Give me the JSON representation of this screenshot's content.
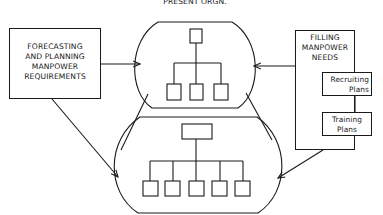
{
  "title": "PRESENT ORGN.",
  "left_box": {
    "lines": [
      "FORECASTING",
      "AND PLANNING",
      "MANPOWER",
      "REQUIREMENTS"
    ]
  },
  "right_box": {
    "lines": [
      "FILLING",
      "MANPOWER",
      "NEEDS"
    ],
    "sub_boxes": [
      {
        "lines": [
          "Recruiting",
          "Plans"
        ]
      },
      {
        "lines": [
          "Training",
          "Plans"
        ]
      }
    ]
  },
  "top_org": {
    "label": "present-organization",
    "child_count": 3
  },
  "bottom_org": {
    "label": "future-organization",
    "child_count": 5
  },
  "colors": {
    "stroke": "#1a1a1a",
    "background": "#ffffff"
  }
}
